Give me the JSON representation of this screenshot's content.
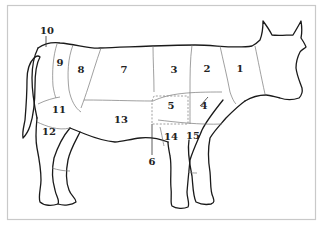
{
  "diagram": {
    "title": "",
    "colors": {
      "outline": "#1a1a1a",
      "cut_lines": "#777777",
      "frame": "#c9c9c9",
      "background": "#ffffff",
      "labels": "#222222"
    },
    "labels": [
      {
        "id": "1",
        "text": "1",
        "x": 240,
        "y": 72
      },
      {
        "id": "2",
        "text": "2",
        "x": 207,
        "y": 72
      },
      {
        "id": "3",
        "text": "3",
        "x": 174,
        "y": 73
      },
      {
        "id": "4",
        "text": "4",
        "x": 204,
        "y": 109
      },
      {
        "id": "5",
        "text": "5",
        "x": 171,
        "y": 109
      },
      {
        "id": "6",
        "text": "6",
        "x": 152,
        "y": 165
      },
      {
        "id": "7",
        "text": "7",
        "x": 124,
        "y": 73
      },
      {
        "id": "8",
        "text": "8",
        "x": 81,
        "y": 73
      },
      {
        "id": "9",
        "text": "9",
        "x": 60,
        "y": 66
      },
      {
        "id": "10",
        "text": "10",
        "x": 47,
        "y": 34
      },
      {
        "id": "11",
        "text": "11",
        "x": 59,
        "y": 113
      },
      {
        "id": "12",
        "text": "12",
        "x": 49,
        "y": 135
      },
      {
        "id": "13",
        "text": "13",
        "x": 121,
        "y": 123
      },
      {
        "id": "14",
        "text": "14",
        "x": 171,
        "y": 140
      },
      {
        "id": "15",
        "text": "15",
        "x": 193,
        "y": 139
      }
    ]
  }
}
